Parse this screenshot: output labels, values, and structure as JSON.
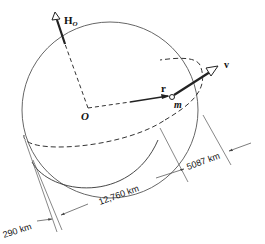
{
  "diagram": {
    "labels": {
      "angular_momentum": "H",
      "angular_momentum_sub": "O",
      "origin": "O",
      "position_vector": "r",
      "velocity": "v",
      "mass": "m"
    },
    "dimensions": {
      "altitude_perigee": "290 km",
      "earth_diameter": "12,760 km",
      "altitude_apogee": "5087 km"
    },
    "colors": {
      "line": "#222222",
      "thin_line": "#555555",
      "background": "#ffffff"
    }
  }
}
